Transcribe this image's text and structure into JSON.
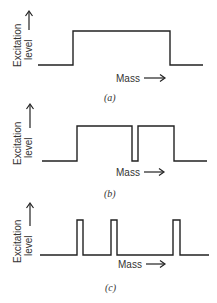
{
  "panels": [
    {
      "id": "a",
      "caption": "(a)",
      "y_label_line1": "Excitation",
      "y_label_line2": "level",
      "x_label": "Mass",
      "description": "single broad excitation band"
    },
    {
      "id": "b",
      "caption": "(b)",
      "y_label_line1": "Excitation",
      "y_label_line2": "level",
      "x_label": "Mass",
      "description": "broad band with a narrow dip"
    },
    {
      "id": "c",
      "caption": "(c)",
      "y_label_line1": "Excitation",
      "y_label_line2": "level",
      "x_label": "Mass",
      "description": "three narrow excitation pulses"
    }
  ],
  "colors": {
    "line": "#222222",
    "text": "#333333",
    "background": "#ffffff"
  }
}
